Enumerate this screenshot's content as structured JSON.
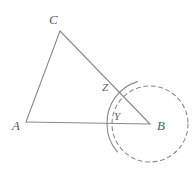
{
  "figure": {
    "kind": "geometry-diagram",
    "width": 196,
    "height": 173,
    "background_color": "#ffffff",
    "stroke_color": "#8a8a8a",
    "label_color": "#5b5b5b",
    "stroke_width": 1.1
  },
  "labels": {
    "a": "A",
    "b": "B",
    "c": "C",
    "y": "Y",
    "z": "Z"
  },
  "points": {
    "A": {
      "x": 26,
      "y": 122
    },
    "B": {
      "x": 150,
      "y": 124
    },
    "C": {
      "x": 60,
      "y": 31
    },
    "Z": {
      "x": 114,
      "y": 89
    },
    "Y": {
      "x": 122,
      "y": 123
    }
  },
  "label_positions": {
    "A": {
      "x": 12,
      "y": 119
    },
    "B": {
      "x": 157,
      "y": 119
    },
    "C": {
      "x": 49,
      "y": 13
    },
    "Z": {
      "x": 102,
      "y": 82
    },
    "Y": {
      "x": 114,
      "y": 111
    }
  },
  "segments": [
    {
      "name": "segment-AB",
      "from": "A",
      "to": "B",
      "style": "solid"
    },
    {
      "name": "segment-AC",
      "from": "A",
      "to": "C",
      "style": "solid"
    },
    {
      "name": "segment-CB",
      "from": "C",
      "to": "B",
      "style": "solid"
    }
  ],
  "dashed_circle": {
    "name": "dashed-circle",
    "center": "B",
    "cx": 150,
    "cy": 124,
    "r": 38,
    "style": "dashed",
    "dash_pattern": "4 3.5"
  },
  "angle_arc": {
    "name": "angle-arc-at-B",
    "center": "B",
    "cx": 150,
    "cy": 124,
    "r": 43,
    "style": "solid",
    "start_angle_deg": 180,
    "end_angle_deg": 253
  }
}
